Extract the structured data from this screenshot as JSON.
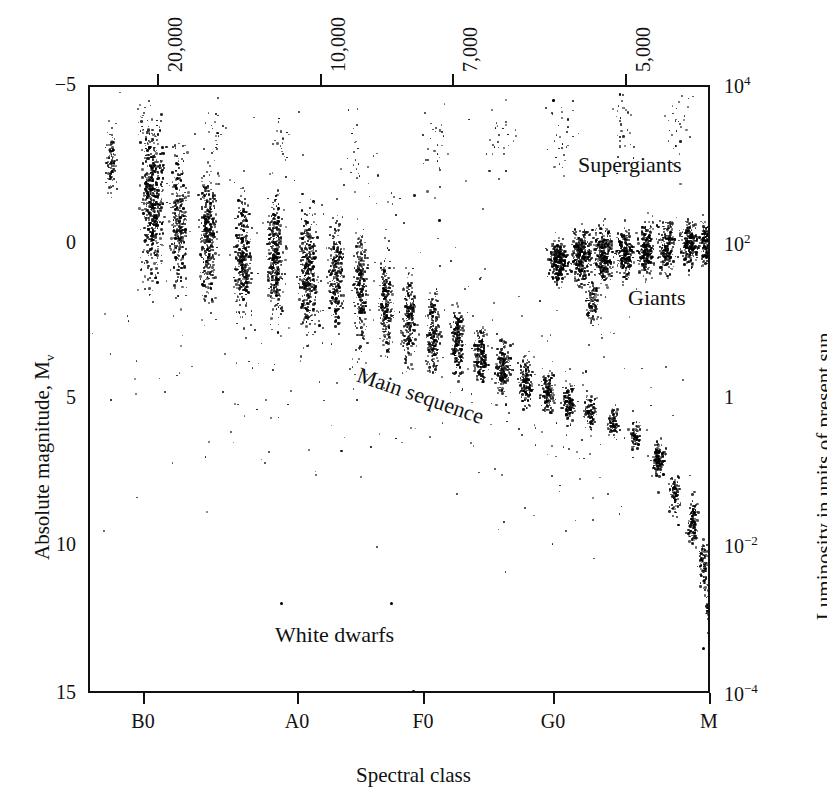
{
  "figure": {
    "kind": "hertzsprung-russell-diagram",
    "background": "#ffffff",
    "ink": "#111111"
  },
  "axes": {
    "bottom": {
      "title": "Spectral class",
      "ticks": [
        {
          "label": "B0",
          "x": 143
        },
        {
          "label": "A0",
          "x": 297
        },
        {
          "label": "F0",
          "x": 423
        },
        {
          "label": "G0",
          "x": 553
        },
        {
          "label": "M",
          "x": 709
        }
      ]
    },
    "top": {
      "title": "",
      "ticks": [
        {
          "label": "20,000",
          "x": 157
        },
        {
          "label": "10,000",
          "x": 320
        },
        {
          "label": "7,000",
          "x": 452
        },
        {
          "label": "5,000",
          "x": 625
        }
      ]
    },
    "left": {
      "title": "Absolute magnitude, M",
      "title_sub": "v",
      "ticks": [
        {
          "label": "-5",
          "y": 85
        },
        {
          "label": "0",
          "y": 243
        },
        {
          "label": "5",
          "y": 398
        },
        {
          "label": "10",
          "y": 545
        },
        {
          "label": "15",
          "y": 693
        }
      ]
    },
    "right": {
      "title": "Luminosity in units of present sun",
      "ticks": [
        {
          "mantissa": "10",
          "exponent": "4",
          "y": 85
        },
        {
          "mantissa": "10",
          "exponent": "2",
          "y": 243
        },
        {
          "mantissa": "1",
          "exponent": "",
          "y": 398
        },
        {
          "mantissa": "10",
          "exponent": "-2",
          "y": 545
        },
        {
          "mantissa": "10",
          "exponent": "-4",
          "y": 693
        }
      ]
    }
  },
  "annotations": [
    {
      "name": "supergiants",
      "text": "Supergiants",
      "x": 578,
      "y": 152,
      "rotate": 0
    },
    {
      "name": "giants",
      "text": "Giants",
      "x": 628,
      "y": 285,
      "rotate": 0
    },
    {
      "name": "main-sequence",
      "text": "Main sequence",
      "x": 362,
      "y": 362,
      "rotate": 19
    },
    {
      "name": "white-dwarfs",
      "text": "White dwarfs",
      "x": 275,
      "y": 622,
      "rotate": 0
    }
  ],
  "chart_data": {
    "type": "scatter",
    "xlabel": "Spectral class",
    "ylabel": "Absolute magnitude, Mv",
    "y2label": "Luminosity in units of present sun",
    "grid": false,
    "legend": null,
    "x_axis": {
      "kind": "categorical-spectral",
      "tick_labels": [
        "B0",
        "A0",
        "F0",
        "G0",
        "M"
      ],
      "secondary_kind": "temperature-kelvin",
      "secondary_tick_labels": [
        "20,000",
        "10,000",
        "7,000",
        "5,000"
      ],
      "direction": "hot-to-cool"
    },
    "y_axis": {
      "tick_labels": [
        "-5",
        "0",
        "5",
        "10",
        "15"
      ],
      "ylim": [
        -5,
        15
      ],
      "inverted": true,
      "secondary_tick_labels": [
        "10^4",
        "10^2",
        "1",
        "10^-2",
        "10^-4"
      ],
      "secondary_lim": [
        10000,
        0.0001
      ],
      "secondary_scale": "log"
    },
    "populations": [
      {
        "name": "main-sequence",
        "description": "Dense band of stars running from upper-left (hot, bright) to lower-right (cool, faint)",
        "point_count_approx": 4800,
        "clumps": [
          {
            "x": 108,
            "y": 160,
            "w": 10,
            "h": 72,
            "n": 100,
            "density": 0.75
          },
          {
            "x": 150,
            "y": 200,
            "w": 22,
            "h": 150,
            "n": 520,
            "density": 0.95
          },
          {
            "x": 176,
            "y": 215,
            "w": 16,
            "h": 140,
            "n": 300,
            "density": 0.85
          },
          {
            "x": 205,
            "y": 232,
            "w": 16,
            "h": 128,
            "n": 330,
            "density": 0.9
          },
          {
            "x": 240,
            "y": 250,
            "w": 15,
            "h": 118,
            "n": 300,
            "density": 0.9
          },
          {
            "x": 272,
            "y": 258,
            "w": 16,
            "h": 118,
            "n": 330,
            "density": 0.9
          },
          {
            "x": 305,
            "y": 268,
            "w": 17,
            "h": 118,
            "n": 350,
            "density": 0.9
          },
          {
            "x": 333,
            "y": 272,
            "w": 14,
            "h": 112,
            "n": 240,
            "density": 0.85
          },
          {
            "x": 358,
            "y": 285,
            "w": 13,
            "h": 104,
            "n": 230,
            "density": 0.85
          },
          {
            "x": 383,
            "y": 300,
            "w": 13,
            "h": 92,
            "n": 200,
            "density": 0.82
          },
          {
            "x": 406,
            "y": 318,
            "w": 14,
            "h": 84,
            "n": 210,
            "density": 0.85
          },
          {
            "x": 430,
            "y": 330,
            "w": 14,
            "h": 76,
            "n": 210,
            "density": 0.85
          },
          {
            "x": 455,
            "y": 340,
            "w": 13,
            "h": 70,
            "n": 190,
            "density": 0.85
          },
          {
            "x": 478,
            "y": 352,
            "w": 13,
            "h": 60,
            "n": 180,
            "density": 0.85
          },
          {
            "x": 500,
            "y": 366,
            "w": 14,
            "h": 52,
            "n": 190,
            "density": 0.88
          },
          {
            "x": 523,
            "y": 378,
            "w": 13,
            "h": 46,
            "n": 160,
            "density": 0.85
          },
          {
            "x": 545,
            "y": 390,
            "w": 13,
            "h": 42,
            "n": 150,
            "density": 0.85
          },
          {
            "x": 566,
            "y": 400,
            "w": 12,
            "h": 38,
            "n": 120,
            "density": 0.8
          },
          {
            "x": 588,
            "y": 410,
            "w": 11,
            "h": 34,
            "n": 100,
            "density": 0.75
          },
          {
            "x": 610,
            "y": 420,
            "w": 10,
            "h": 30,
            "n": 80,
            "density": 0.7
          },
          {
            "x": 632,
            "y": 432,
            "w": 10,
            "h": 28,
            "n": 70,
            "density": 0.65
          },
          {
            "x": 655,
            "y": 455,
            "w": 12,
            "h": 34,
            "n": 140,
            "density": 0.85
          },
          {
            "x": 672,
            "y": 490,
            "w": 10,
            "h": 44,
            "n": 80,
            "density": 0.6
          },
          {
            "x": 690,
            "y": 520,
            "w": 10,
            "h": 50,
            "n": 120,
            "density": 0.8
          },
          {
            "x": 700,
            "y": 560,
            "w": 10,
            "h": 52,
            "n": 90,
            "density": 0.7
          },
          {
            "x": 706,
            "y": 600,
            "w": 9,
            "h": 45,
            "n": 50,
            "density": 0.55
          }
        ]
      },
      {
        "name": "giants",
        "description": "Dense horizontal clump near absolute magnitude 0 toward cool spectral classes",
        "point_count_approx": 1900,
        "clumps": [
          {
            "x": 556,
            "y": 258,
            "w": 18,
            "h": 40,
            "n": 260,
            "density": 0.95
          },
          {
            "x": 578,
            "y": 252,
            "w": 20,
            "h": 52,
            "n": 300,
            "density": 0.95
          },
          {
            "x": 600,
            "y": 252,
            "w": 18,
            "h": 56,
            "n": 280,
            "density": 0.95
          },
          {
            "x": 622,
            "y": 250,
            "w": 16,
            "h": 48,
            "n": 220,
            "density": 0.9
          },
          {
            "x": 643,
            "y": 245,
            "w": 16,
            "h": 56,
            "n": 230,
            "density": 0.9
          },
          {
            "x": 664,
            "y": 243,
            "w": 15,
            "h": 52,
            "n": 200,
            "density": 0.9
          },
          {
            "x": 686,
            "y": 240,
            "w": 16,
            "h": 46,
            "n": 210,
            "density": 0.92
          },
          {
            "x": 703,
            "y": 240,
            "w": 13,
            "h": 40,
            "n": 150,
            "density": 0.88
          },
          {
            "x": 590,
            "y": 300,
            "w": 14,
            "h": 44,
            "n": 110,
            "density": 0.6
          }
        ]
      },
      {
        "name": "supergiants",
        "description": "Sparse scatter of very luminous stars across the top of the diagram",
        "point_count_approx": 260,
        "clumps": [
          {
            "x": 140,
            "y": 120,
            "w": 20,
            "h": 50,
            "n": 26,
            "density": 0.2
          },
          {
            "x": 210,
            "y": 130,
            "w": 24,
            "h": 60,
            "n": 24,
            "density": 0.18
          },
          {
            "x": 280,
            "y": 140,
            "w": 26,
            "h": 70,
            "n": 22,
            "density": 0.16
          },
          {
            "x": 350,
            "y": 150,
            "w": 30,
            "h": 80,
            "n": 22,
            "density": 0.15
          },
          {
            "x": 430,
            "y": 140,
            "w": 30,
            "h": 90,
            "n": 26,
            "density": 0.16
          },
          {
            "x": 500,
            "y": 135,
            "w": 30,
            "h": 90,
            "n": 24,
            "density": 0.16
          },
          {
            "x": 560,
            "y": 128,
            "w": 34,
            "h": 90,
            "n": 32,
            "density": 0.2
          },
          {
            "x": 620,
            "y": 120,
            "w": 34,
            "h": 92,
            "n": 34,
            "density": 0.2
          },
          {
            "x": 678,
            "y": 118,
            "w": 32,
            "h": 96,
            "n": 30,
            "density": 0.2
          }
        ]
      },
      {
        "name": "white-dwarfs",
        "description": "A few isolated faint points well below the main sequence",
        "point_count_approx": 5,
        "points": [
          {
            "x": 278,
            "y": 600
          },
          {
            "x": 388,
            "y": 600
          },
          {
            "x": 410,
            "y": 688
          },
          {
            "x": 700,
            "y": 645
          },
          {
            "x": 713,
            "y": 664
          }
        ]
      },
      {
        "name": "background-speckle",
        "description": "Scanner speckle / sparse field stars spread over the plot area",
        "point_count_approx": 420,
        "clumps": [
          {
            "x": 300,
            "y": 300,
            "w": 440,
            "h": 420,
            "n": 240,
            "density": 0.06
          },
          {
            "x": 560,
            "y": 420,
            "w": 300,
            "h": 300,
            "n": 120,
            "density": 0.05
          }
        ]
      }
    ]
  }
}
